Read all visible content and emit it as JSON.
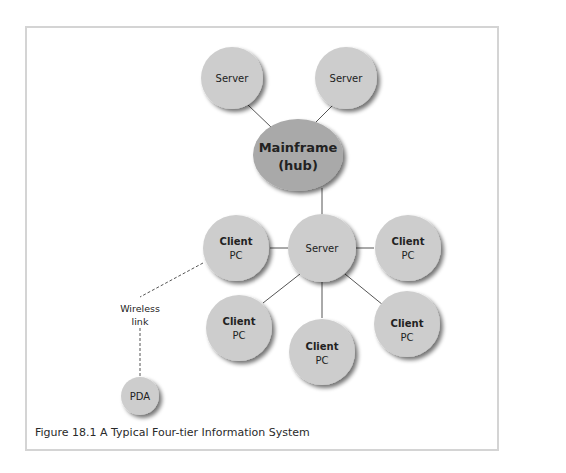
{
  "figure": {
    "caption": "Figure 18.1  A Typical Four-tier Information System",
    "colors": {
      "node_fill": "#cdcdcd",
      "hub_fill": "#a9a9a9",
      "shadow": "#8a8a8a",
      "edge": "#555555",
      "frame_border": "#d4d4d4"
    }
  },
  "nodes": {
    "server_top_left": {
      "line1": "Server",
      "line2": ""
    },
    "server_top_right": {
      "line1": "Server",
      "line2": ""
    },
    "mainframe": {
      "line1": "Mainframe",
      "line2": "(hub)"
    },
    "server_mid": {
      "line1": "Server",
      "line2": ""
    },
    "client_left": {
      "line1": "Client",
      "line2": "PC"
    },
    "client_right": {
      "line1": "Client",
      "line2": "PC"
    },
    "client_bottom_left": {
      "line1": "Client",
      "line2": "PC"
    },
    "client_bottom_mid": {
      "line1": "Client",
      "line2": "PC"
    },
    "client_bottom_right": {
      "line1": "Client",
      "line2": "PC"
    },
    "pda": {
      "line1": "PDA",
      "line2": ""
    }
  },
  "annotations": {
    "wireless_line1": "Wireless",
    "wireless_line2": "link"
  }
}
